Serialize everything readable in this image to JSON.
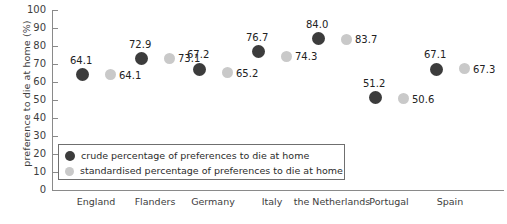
{
  "chart_data": {
    "type": "scatter",
    "title": "",
    "xlabel": "",
    "ylabel": "preference to die at home (%)",
    "ylim": [
      0,
      100
    ],
    "ytick_step": 10,
    "yticks": [
      "100",
      "90",
      "80",
      "70",
      "60",
      "50",
      "40",
      "30",
      "20",
      "10",
      "0"
    ],
    "grid": false,
    "legend_position": "inside-lower-left",
    "categories": [
      "England",
      "Flanders",
      "Germany",
      "Italy",
      "the Netherlands",
      "Portugal",
      "Spain"
    ],
    "series": [
      {
        "name": "crude percentage of preferences to die at home",
        "color": "#3c3c3c",
        "marker": "filled-circle-dark",
        "values": [
          64.1,
          72.9,
          67.2,
          76.7,
          84.0,
          51.2,
          67.1
        ],
        "labels": [
          "64.1",
          "72.9",
          "67.2",
          "76.7",
          "84.0",
          "51.2",
          "67.1"
        ]
      },
      {
        "name": "standardised percentage of preferences to die at home",
        "color": "#c9c9c9",
        "marker": "filled-circle-light",
        "values": [
          64.1,
          73.1,
          65.2,
          74.3,
          83.7,
          50.6,
          67.3
        ],
        "labels": [
          "64.1",
          "73.1",
          "65.2",
          "74.3",
          "83.7",
          "50.6",
          "67.3"
        ]
      }
    ]
  },
  "legend": {
    "items": [
      {
        "label": "crude percentage of preferences to die at home"
      },
      {
        "label": "standardised percentage of preferences to die at home"
      }
    ]
  },
  "colors": {
    "crude": "#3c3c3c",
    "standardised": "#c9c9c9",
    "axis": "#8a8a8a",
    "text": "#2b2b2b"
  }
}
